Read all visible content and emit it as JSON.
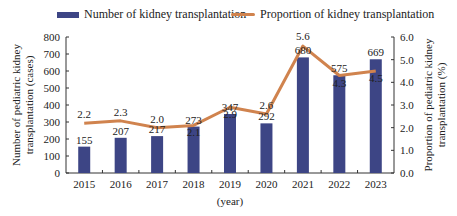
{
  "chart_data": {
    "type": "bar+line",
    "title": "",
    "categories": [
      "2015",
      "2016",
      "2017",
      "2018",
      "2019",
      "2020",
      "2021",
      "2022",
      "2023"
    ],
    "series": [
      {
        "name": "Number of kidney transplantation",
        "type": "bar",
        "axis": "left",
        "color": "#3d4585",
        "values": [
          155,
          207,
          217,
          273,
          347,
          292,
          680,
          575,
          669
        ]
      },
      {
        "name": "Proportion of kidney transplantation",
        "type": "line",
        "axis": "right",
        "color": "#d0834e",
        "values": [
          2.2,
          2.3,
          2.0,
          2.1,
          2.9,
          2.6,
          5.6,
          4.3,
          4.5
        ]
      }
    ],
    "xlabel": "(year)",
    "ylabel_left": "Number of pediatric kidney transplantation (cases)",
    "ylabel_right": "Proportion of pediatric kidney transplantation (%)",
    "ylim_left": [
      0,
      800
    ],
    "ylim_right": [
      0,
      6.0
    ],
    "yticks_left": [
      "0",
      "100",
      "200",
      "300",
      "400",
      "500",
      "600",
      "700",
      "800"
    ],
    "yticks_right": [
      "0.0",
      "1.0",
      "2.0",
      "3.0",
      "4.0",
      "5.0",
      "6.0"
    ],
    "grid": false,
    "legend_position": "top"
  },
  "legend": {
    "bar_label": "Number of kidney transplantation",
    "line_label": "Proportion of kidney transplantation"
  }
}
